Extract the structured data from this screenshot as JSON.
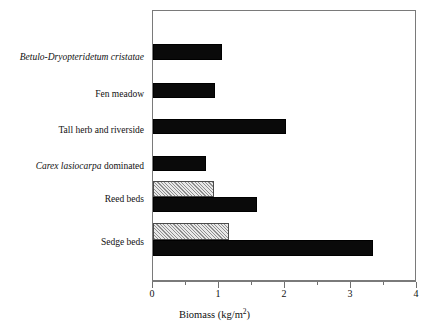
{
  "chart_data": {
    "type": "bar",
    "orientation": "horizontal",
    "title": "",
    "xlabel": "Biomass (kg/m2)",
    "xlabel_parts": {
      "text": "Biomass (kg/m",
      "sup": "2",
      "tail": ")"
    },
    "ylabel": "",
    "xlim": [
      0,
      4
    ],
    "xticks": [
      0,
      1,
      2,
      3,
      4
    ],
    "xtick_labels": [
      "0",
      "1",
      "2",
      "3",
      "4"
    ],
    "minor_xticks": [
      0.5,
      1.5,
      2.5,
      3.5
    ],
    "grid": false,
    "legend": "none",
    "categories": [
      "Betulo-Dryopteridetum cristatae",
      "Fen meadow",
      "Tall herb and riverside",
      "Carex lasiocarpa dominated",
      "Reed beds",
      "Sedge beds"
    ],
    "series": [
      {
        "name": "hatched",
        "pattern": "diagonal-hatch",
        "color": "#d6d6d6",
        "values": [
          null,
          null,
          null,
          null,
          0.93,
          1.15
        ]
      },
      {
        "name": "solid",
        "pattern": "solid",
        "color": "#0a0a0a",
        "values": [
          1.05,
          0.94,
          2.02,
          0.8,
          1.58,
          3.33
        ]
      }
    ]
  },
  "labels": [
    {
      "id": "betulo",
      "pre_italic": "Betulo-Dryopteridetum cristatae",
      "post_roman": ""
    },
    {
      "id": "fen-meadow",
      "pre_italic": "",
      "post_roman": "Fen meadow"
    },
    {
      "id": "tall-herb",
      "pre_italic": "",
      "post_roman": "Tall herb and riverside"
    },
    {
      "id": "carex",
      "pre_italic": "Carex lasiocarpa",
      "post_roman": " dominated"
    },
    {
      "id": "reed-beds",
      "pre_italic": "",
      "post_roman": "Reed beds"
    },
    {
      "id": "sedge-beds",
      "pre_italic": "",
      "post_roman": "Sedge beds"
    }
  ],
  "axis": {
    "tick_labels": [
      "0",
      "1",
      "2",
      "3",
      "4"
    ],
    "title_main": "Biomass (kg/m",
    "title_sup": "2",
    "title_tail": ")"
  },
  "colors": {
    "solid_bar": "#0a0a0a",
    "hatch_bar_bg": "#d6d6d6",
    "hatch_line": "#8e8e8e",
    "frame": "#7a7a7a",
    "text": "#111111"
  }
}
